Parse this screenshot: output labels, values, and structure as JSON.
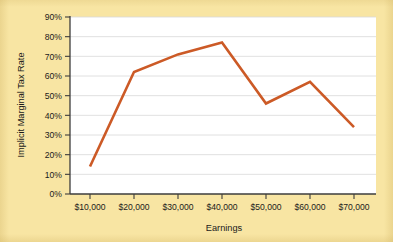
{
  "chart_data": {
    "type": "line",
    "title": "",
    "xlabel": "Earnings",
    "ylabel": "Implicit Marginal Tax Rate",
    "categories": [
      "$10,000",
      "$20,000",
      "$30,000",
      "$40,000",
      "$50,000",
      "$60,000",
      "$70,000"
    ],
    "x": [
      10000,
      20000,
      30000,
      40000,
      50000,
      60000,
      70000
    ],
    "values": [
      14,
      62,
      71,
      77,
      46,
      57,
      34
    ],
    "series": [
      {
        "name": "Implicit Marginal Tax Rate",
        "values": [
          14,
          62,
          71,
          77,
          46,
          57,
          34
        ]
      }
    ],
    "ylim": [
      0,
      90
    ],
    "ytick_values": [
      0,
      10,
      20,
      30,
      40,
      50,
      60,
      70,
      80,
      90
    ],
    "ytick_labels": [
      "0%",
      "10%",
      "20%",
      "30%",
      "40%",
      "50%",
      "60%",
      "70%",
      "80%",
      "90%"
    ],
    "xtick_labels": [
      "$10,000",
      "$20,000",
      "$30,000",
      "$40,000",
      "$50,000",
      "$60,000",
      "$70,000"
    ],
    "grid": "horizontal",
    "legend": "none",
    "line_color": "#cc5a26",
    "plot_background": "#ffffff",
    "figure_background": "#f8e5a3"
  }
}
